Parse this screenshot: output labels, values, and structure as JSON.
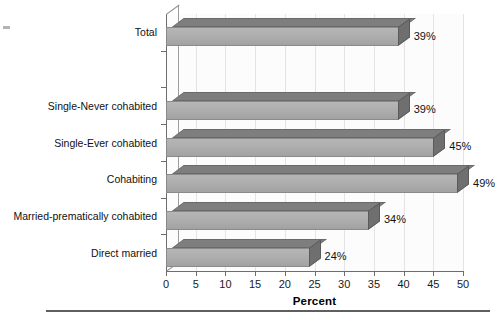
{
  "chart_data": {
    "type": "bar",
    "orientation": "horizontal",
    "title": "",
    "xlabel": "Percent",
    "ylabel": "",
    "categories": [
      "Total",
      "",
      "Single-Never cohabited",
      "Single-Ever cohabited",
      "Cohabiting",
      "Married-prematically cohabited",
      "Direct married"
    ],
    "values": [
      39,
      null,
      39,
      45,
      49,
      34,
      24
    ],
    "data_labels": [
      "39%",
      "",
      "39%",
      "45%",
      "49%",
      "34%",
      "24%"
    ],
    "xlim": [
      0,
      50
    ],
    "xticks": [
      0,
      5,
      10,
      15,
      20,
      25,
      30,
      35,
      40,
      45,
      50
    ],
    "xticklabels": [
      "0",
      "5",
      "10",
      "15",
      "20",
      "25",
      "30",
      "35",
      "40",
      "45",
      "50"
    ],
    "grid": true,
    "grid_axis": "x",
    "legend": false,
    "style": "3d-horizontal-bar",
    "colors": {
      "bar_front": "#aeaeae",
      "bar_top": "#7e7e7e",
      "bar_cap": "#6f6f6f",
      "axis": "#6d6d6d",
      "gridline": "#e4e4e4",
      "text": "#111111",
      "background": "#ffffff",
      "rule": "#5f5f5f"
    }
  }
}
